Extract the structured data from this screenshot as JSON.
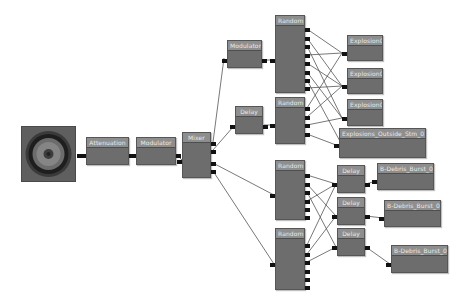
{
  "editor": {
    "background": "#ffffff",
    "node_header_color": "#8e8e8e",
    "node_body_color": "#6d6d6d",
    "pin_color": "#111111",
    "wire_color": "#555555"
  },
  "output_node": {
    "icon": "speaker-icon"
  },
  "nodes": {
    "attenuation": {
      "label": "Attenuation"
    },
    "modulator_main": {
      "label": "Modulator"
    },
    "mixer": {
      "label": "Mixer"
    },
    "modulator_upper": {
      "label": "Modulator"
    },
    "delay_upper": {
      "label": "Delay"
    },
    "random_1": {
      "label": "Random",
      "outputs": 8
    },
    "random_2": {
      "label": "Random",
      "outputs": 4
    },
    "random_3": {
      "label": "Random",
      "outputs": 6
    },
    "random_4": {
      "label": "Random",
      "outputs": 6
    },
    "delay_1": {
      "label": "Delay"
    },
    "delay_2": {
      "label": "Delay"
    },
    "delay_3": {
      "label": "Delay"
    },
    "wave_explosion01": {
      "label": "Explosion01"
    },
    "wave_explosion02": {
      "label": "Explosion02"
    },
    "wave_explosion03": {
      "label": "Explosion03"
    },
    "wave_outside": {
      "label": "Explosions_Outside_Stm_01"
    },
    "wave_debris01": {
      "label": "B-Debris_Burst_01"
    },
    "wave_debris02": {
      "label": "B-Debris_Burst_02"
    },
    "wave_debris03": {
      "label": "B-Debris_Burst_03"
    }
  }
}
